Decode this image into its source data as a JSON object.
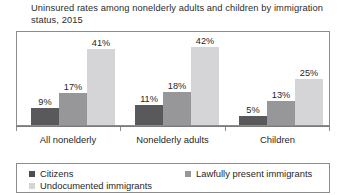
{
  "chart_data": {
    "type": "bar",
    "title": "Uninsured rates among nonelderly adults and children by immigration status, 2015",
    "title_line_1": "Uninsured rates among nonelderly adults and children by",
    "title_line_2": "immigration status, 2015",
    "xlabel": "",
    "ylabel": "",
    "ylim": [
      0,
      50
    ],
    "grid": false,
    "legend_position": "bottom",
    "value_suffix": "%",
    "categories": [
      "All nonelderly",
      "Nonelderly adults",
      "Children"
    ],
    "series": [
      {
        "name": "Citizens",
        "color": "#59595b",
        "values": [
          9,
          17,
          5
        ],
        "labels": [
          "9%",
          "17%",
          "5%"
        ]
      },
      {
        "name": "Lawfully present immigrants",
        "color": "#97979a",
        "values": [
          17,
          18,
          13
        ],
        "labels": [
          "17%",
          "18%",
          "13%"
        ]
      },
      {
        "name": "Undocumented immigrants",
        "color": "#d5d5d7",
        "values": [
          41,
          42,
          25
        ],
        "labels": [
          "41%",
          "42%",
          "25%"
        ]
      }
    ],
    "groups": [
      {
        "category": "All nonelderly",
        "bars": [
          {
            "series": "Citizens",
            "value": 9,
            "label": "9%"
          },
          {
            "series": "Lawfully present immigrants",
            "value": 17,
            "label": "17%"
          },
          {
            "series": "Undocumented immigrants",
            "value": 41,
            "label": "41%"
          }
        ]
      },
      {
        "category": "Nonelderly adults",
        "bars": [
          {
            "series": "Citizens",
            "value": 11,
            "label": "11%"
          },
          {
            "series": "Lawfully present immigrants",
            "value": 18,
            "label": "18%"
          },
          {
            "series": "Undocumented immigrants",
            "value": 42,
            "label": "42%"
          }
        ]
      },
      {
        "category": "Children",
        "bars": [
          {
            "series": "Citizens",
            "value": 5,
            "label": "5%"
          },
          {
            "series": "Lawfully present immigrants",
            "value": 13,
            "label": "13%"
          },
          {
            "series": "Undocumented immigrants",
            "value": 25,
            "label": "25%"
          }
        ]
      }
    ]
  },
  "legend": {
    "entries": [
      {
        "label": "Citizens",
        "color": "#4d4d50"
      },
      {
        "label": "Lawfully present immigrants",
        "color": "#97979a"
      },
      {
        "label": "Undocumented immigrants",
        "color": "#d5d5d7"
      }
    ]
  }
}
